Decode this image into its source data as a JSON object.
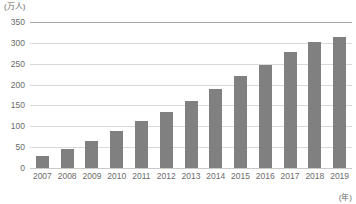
{
  "chart_data": {
    "type": "bar",
    "title": "",
    "xlabel": "(年)",
    "ylabel": "(万人)",
    "categories": [
      "2007",
      "2008",
      "2009",
      "2010",
      "2011",
      "2012",
      "2013",
      "2014",
      "2015",
      "2016",
      "2017",
      "2018",
      "2019"
    ],
    "values": [
      30,
      45,
      65,
      88,
      112,
      135,
      160,
      190,
      220,
      248,
      278,
      302,
      315
    ],
    "ylim": [
      0,
      350
    ],
    "yticks": [
      0,
      50,
      100,
      150,
      200,
      250,
      300,
      350
    ],
    "ytick_labels": [
      "0",
      "50",
      "100",
      "150",
      "200",
      "250",
      "300",
      "350"
    ],
    "grid": true,
    "legend": false,
    "series_color": "#808080",
    "gridline_color": "#d9d9d9",
    "axis_color": "#a6a6a6"
  }
}
